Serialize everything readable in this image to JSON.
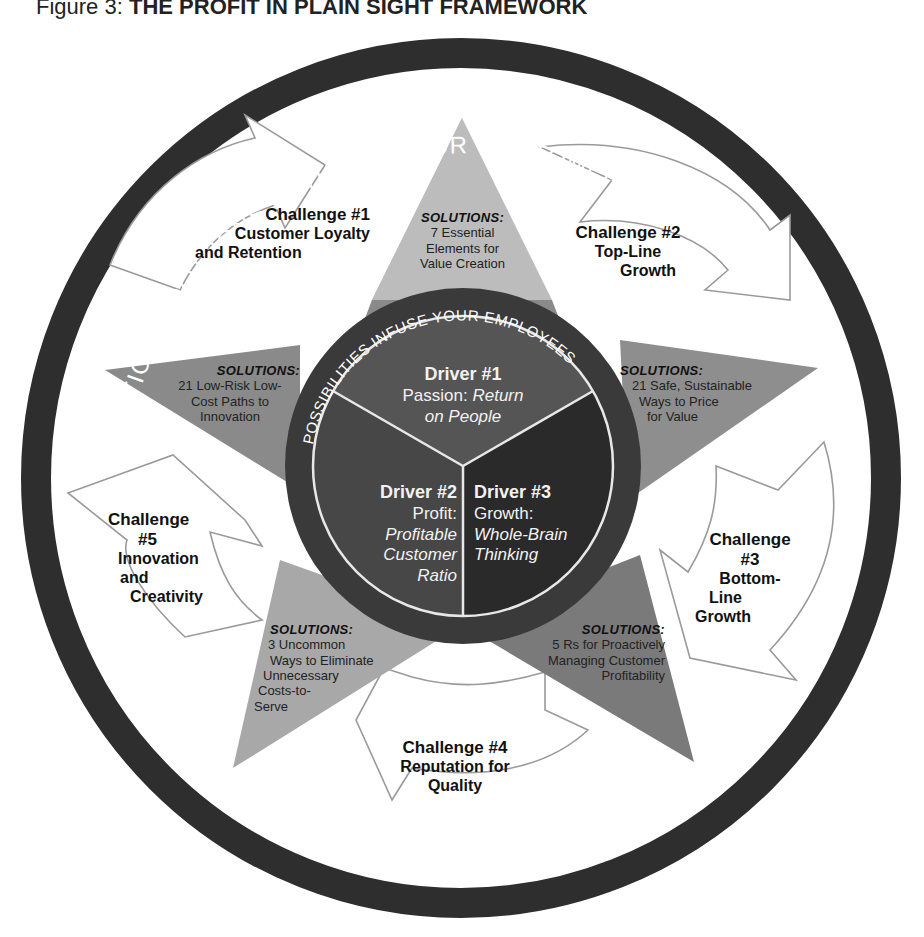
{
  "figure": {
    "label": "Figure 3:",
    "title": "THE PROFIT IN PLAIN SIGHT FRAMEWORK"
  },
  "outer_ring": {
    "text": "PRACTICAL SOLUTIONS ENTHUSE YOUR CUSTOMERS"
  },
  "inner_ring": {
    "text": "POSSIBILITIES INFUSE YOUR EMPLOYEES"
  },
  "challenges": [
    {
      "title": "Challenge #1",
      "lines": [
        "Customer Loyalty",
        "and Retention"
      ]
    },
    {
      "title": "Challenge #2",
      "lines": [
        "Top-Line",
        "Growth"
      ]
    },
    {
      "title_lines": [
        "Challenge",
        "#3"
      ],
      "lines": [
        "Bottom-",
        "Line",
        "Growth"
      ]
    },
    {
      "title": "Challenge #4",
      "lines": [
        "Reputation for",
        "Quality"
      ]
    },
    {
      "title_lines": [
        "Challenge",
        "#5"
      ],
      "lines": [
        "Innovation",
        "and",
        "Creativity"
      ]
    }
  ],
  "solutions": [
    {
      "heading": "SOLUTIONS:",
      "lines": [
        "7 Essential",
        "Elements for",
        "Value Creation"
      ]
    },
    {
      "heading": "SOLUTIONS:",
      "lines": [
        "21 Safe, Sustainable",
        "Ways to Price",
        "for Value"
      ]
    },
    {
      "heading": "SOLUTIONS:",
      "lines": [
        "5 Rs for Proactively",
        "Managing Customer",
        "Profitability"
      ]
    },
    {
      "heading": "SOLUTIONS:",
      "lines": [
        "3 Uncommon",
        "Ways to Eliminate",
        "Unnecessary",
        "Costs-to-",
        "Serve"
      ]
    },
    {
      "heading": "SOLUTIONS:",
      "lines": [
        "21 Low-Risk Low-",
        "Cost Paths to",
        "Innovation"
      ]
    }
  ],
  "drivers": [
    {
      "title": "Driver #1",
      "label": "Passion:",
      "italic_lines": [
        "Return",
        "on People"
      ]
    },
    {
      "title": "Driver #2",
      "label": "Profit:",
      "italic_lines": [
        "Profitable",
        "Customer",
        "Ratio"
      ]
    },
    {
      "title": "Driver #3",
      "label": "Growth:",
      "italic_lines": [
        "Whole-Brain",
        "Thinking"
      ]
    }
  ],
  "colors": {
    "outer_ring": "#2e2e2e",
    "star_top": "#bcbcbc",
    "star_right": "#8e8e8e",
    "star_bottom_right": "#7a7a7a",
    "star_bottom_left": "#a8a8a8",
    "star_left": "#8a8a8a",
    "inner_ring": "#3a3a3a",
    "driver1": "#555555",
    "driver2": "#474747",
    "driver3": "#2a2a2a",
    "arrow_stroke": "#9a9a9a"
  }
}
